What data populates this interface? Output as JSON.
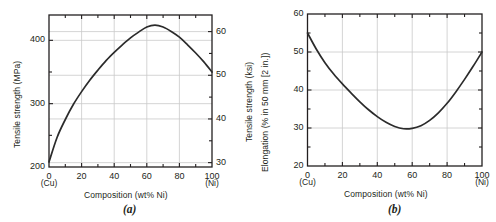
{
  "figure": {
    "background": "#ffffff",
    "curve_color": "#2b2b2b",
    "axis_color": "#231f20",
    "grid_color": "#c9c9c9"
  },
  "panels": [
    {
      "id": "a",
      "letter": "(a)",
      "chart_data": {
        "type": "line",
        "title": "",
        "xlabel": "Composition (wt% Ni)",
        "ylabel": "Tensile strength (MPa)",
        "y2label": "Tensile strength (ksi)",
        "xlim": [
          0,
          100
        ],
        "ylim": [
          200,
          440
        ],
        "y2lim": [
          29,
          63.8
        ],
        "grid": true,
        "legend": "none",
        "x_ticks": [
          0,
          20,
          40,
          60,
          80,
          100
        ],
        "x_ticklabels": [
          "0",
          "20",
          "40",
          "60",
          "80",
          "100"
        ],
        "x_minor_ticks": [
          10,
          30,
          50,
          70,
          90
        ],
        "x_end_labels": {
          "left": "(Cu)",
          "right": "(Ni)"
        },
        "y_ticks": [
          200,
          300,
          400
        ],
        "y_ticklabels": [
          "200",
          "300",
          "400"
        ],
        "y_minor_ticks": [
          250,
          350
        ],
        "y2_ticks": [
          30,
          40,
          50,
          60
        ],
        "y2_ticklabels": [
          "30",
          "40",
          "50",
          "60"
        ],
        "series": [
          {
            "name": "Tensile strength",
            "x": [
              0,
              5,
              10,
              15,
              20,
              25,
              30,
              35,
              40,
              45,
              50,
              55,
              60,
              65,
              70,
              75,
              80,
              85,
              90,
              95,
              100
            ],
            "values": [
              208,
              247,
              275,
              299,
              319,
              337,
              353,
              368,
              381,
              393,
              404,
              413,
              421,
              424,
              421,
              414,
              405,
              393,
              380,
              366,
              350
            ]
          }
        ]
      }
    },
    {
      "id": "b",
      "letter": "(b)",
      "chart_data": {
        "type": "line",
        "title": "",
        "xlabel": "Composition (wt% Ni)",
        "ylabel": "Elongation (% in 50 mm [2 in.])",
        "xlim": [
          0,
          100
        ],
        "ylim": [
          20,
          60
        ],
        "grid": true,
        "legend": "none",
        "x_ticks": [
          0,
          20,
          40,
          60,
          80,
          100
        ],
        "x_ticklabels": [
          "0",
          "20",
          "40",
          "60",
          "80",
          "100"
        ],
        "x_minor_ticks": [
          10,
          30,
          50,
          70,
          90
        ],
        "x_end_labels": {
          "left": "(Cu)",
          "right": "(Ni)"
        },
        "y_ticks": [
          20,
          30,
          40,
          50,
          60
        ],
        "y_ticklabels": [
          "20",
          "30",
          "40",
          "50",
          "60"
        ],
        "y_minor_ticks": [
          25,
          35,
          45,
          55
        ],
        "series": [
          {
            "name": "Elongation",
            "x": [
              0,
              5,
              10,
              15,
              20,
              25,
              30,
              35,
              40,
              45,
              50,
              55,
              60,
              65,
              70,
              75,
              80,
              85,
              90,
              95,
              100
            ],
            "values": [
              55.0,
              50.8,
              47.2,
              44.2,
              41.6,
              39.2,
              36.9,
              34.8,
              33.0,
              31.5,
              30.4,
              29.8,
              29.9,
              30.6,
              32.0,
              34.0,
              36.5,
              39.5,
              42.8,
              46.3,
              50.0
            ]
          }
        ]
      }
    }
  ]
}
